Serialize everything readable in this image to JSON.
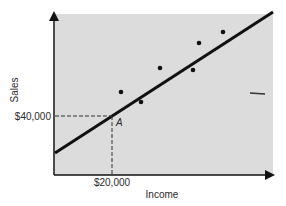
{
  "chart_data": {
    "type": "scatter",
    "title": "",
    "xlabel": "Income",
    "ylabel": "Sales",
    "grid": false,
    "legend": null,
    "x_tick_labels": [
      "$20,000"
    ],
    "y_tick_labels": [
      "$40,000"
    ],
    "points": [
      {
        "x": 121,
        "y": 92
      },
      {
        "x": 141,
        "y": 102
      },
      {
        "x": 160,
        "y": 68
      },
      {
        "x": 193,
        "y": 70
      },
      {
        "x": 199,
        "y": 43
      },
      {
        "x": 223,
        "y": 32
      }
    ],
    "regression_line": {
      "x1": 55,
      "y1": 153,
      "x2": 273,
      "y2": 12
    },
    "annotation": {
      "label": "A",
      "x_value": "$20,000",
      "y_value": "$40,000",
      "px": 112,
      "py": 116
    },
    "colors": {
      "plot_background": "#dcdcdc",
      "line": "#111111",
      "points": "#111111",
      "axes": "#111111"
    }
  }
}
